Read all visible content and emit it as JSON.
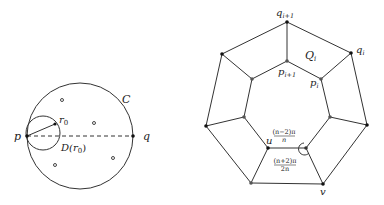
{
  "left_figure": {
    "labels": {
      "p": "p",
      "q": "q",
      "C": "C",
      "r0": "r",
      "r0_sub": "0",
      "D": "D(r",
      "D_sub": "0",
      "D_close": ")"
    },
    "points_count": 4
  },
  "right_figure": {
    "labels": {
      "q_next": "q",
      "q_next_sub": "i+1",
      "q_i": "q",
      "q_i_sub": "i",
      "Q_i": "Q",
      "Q_i_sub": "i",
      "p_next": "p",
      "p_next_sub": "i+1",
      "p_i": "p",
      "p_i_sub": "i",
      "u": "u",
      "v": "v",
      "angle_top_num": "(n−2)π",
      "angle_top_den": "n",
      "angle_bottom_num": "(n+2)π",
      "angle_bottom_den": "2n"
    }
  },
  "colors": {
    "stroke": "#333333",
    "vertex_dark": "#111111",
    "vertex_gray": "#555555"
  }
}
